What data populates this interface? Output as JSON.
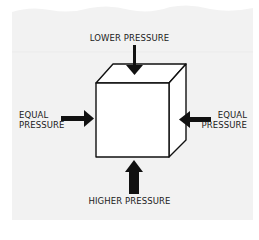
{
  "diagram": {
    "type": "pressure-on-cube illustration",
    "background_color": "#f2f2f2",
    "cube_face_color": "#ffffff",
    "stroke_color": "#111111",
    "labels": {
      "top": "LOWER PRESSURE",
      "bottom": "HIGHER PRESSURE",
      "left_line1": "EQUAL",
      "left_line2": "PRESSURE",
      "right_line1": "EQUAL",
      "right_line2": "PRESSURE"
    },
    "arrows": [
      {
        "position": "top",
        "direction": "down",
        "size": "thin"
      },
      {
        "position": "left",
        "direction": "right",
        "size": "medium"
      },
      {
        "position": "right",
        "direction": "left",
        "size": "medium"
      },
      {
        "position": "bottom",
        "direction": "up",
        "size": "thick"
      }
    ]
  }
}
